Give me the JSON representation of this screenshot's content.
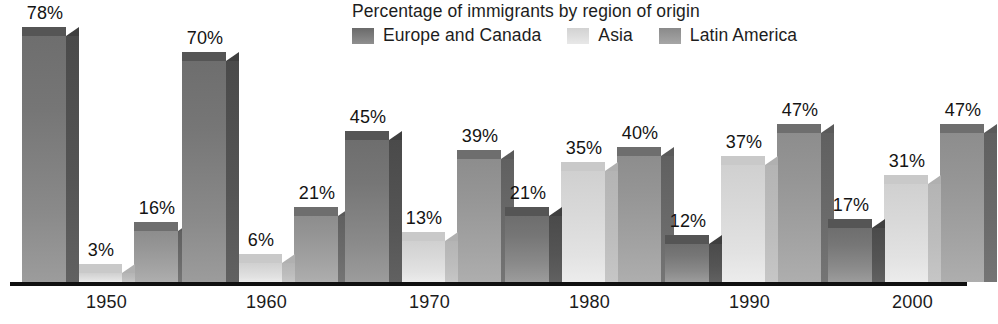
{
  "chart_data": {
    "type": "bar",
    "title": "Percentage of immigrants by region of origin",
    "xlabel": "",
    "ylabel": "",
    "ylim": [
      0,
      80
    ],
    "grid": false,
    "legend_position": "top",
    "categories": [
      "1950",
      "1960",
      "1970",
      "1980",
      "1990",
      "2000"
    ],
    "series": [
      {
        "name": "Europe and Canada",
        "color": "#7b7b7b",
        "values": [
          78,
          70,
          45,
          21,
          12,
          17
        ],
        "labels": [
          "78%",
          "70%",
          "45%",
          "21%",
          "12%",
          "17%"
        ]
      },
      {
        "name": "Asia",
        "color": "#dcdcdc",
        "values": [
          3,
          6,
          13,
          35,
          37,
          31
        ],
        "labels": [
          "3%",
          "6%",
          "13%",
          "35%",
          "37%",
          "31%"
        ]
      },
      {
        "name": "Latin America",
        "color": "#9b9b9b",
        "values": [
          16,
          21,
          39,
          40,
          47,
          47
        ],
        "labels": [
          "16%",
          "21%",
          "39%",
          "40%",
          "47%",
          "47%"
        ]
      }
    ]
  },
  "legend": {
    "items": [
      {
        "label": "Europe and Canada",
        "swatch": "europe-swatch"
      },
      {
        "label": "Asia",
        "swatch": "asia-swatch"
      },
      {
        "label": "Latin America",
        "swatch": "latin-america-swatch"
      }
    ]
  },
  "axis": {
    "baseline_name": "category-axis-line"
  }
}
